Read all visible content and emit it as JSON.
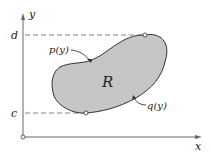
{
  "diagram": {
    "axes": {
      "x_label": "x",
      "y_label": "y"
    },
    "levels": {
      "top_label": "d",
      "bottom_label": "c"
    },
    "curves": {
      "left_label": "p(y)",
      "right_label": "q(y)"
    },
    "region_label": "R",
    "colors": {
      "region_fill": "#c8c8c8",
      "stroke": "#333333",
      "axis": "#555555",
      "dash": "#666666"
    }
  }
}
